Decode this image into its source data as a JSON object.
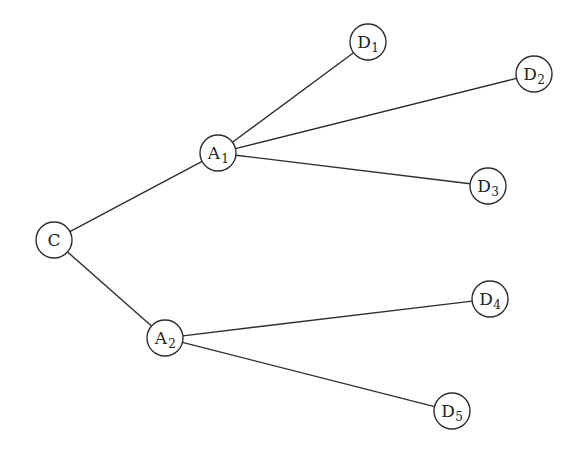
{
  "diagram": {
    "type": "tree",
    "colors": {
      "stroke": "#2e2e2e",
      "text": "#222222",
      "background": "#ffffff"
    },
    "node_radius": 18,
    "nodes": [
      {
        "id": "C",
        "label": "C",
        "sub": "",
        "x": 54,
        "y": 240
      },
      {
        "id": "A1",
        "label": "A",
        "sub": "1",
        "x": 218,
        "y": 153
      },
      {
        "id": "A2",
        "label": "A",
        "sub": "2",
        "x": 165,
        "y": 338
      },
      {
        "id": "D1",
        "label": "D",
        "sub": "1",
        "x": 368,
        "y": 42
      },
      {
        "id": "D2",
        "label": "D",
        "sub": "2",
        "x": 534,
        "y": 74
      },
      {
        "id": "D3",
        "label": "D",
        "sub": "3",
        "x": 488,
        "y": 186
      },
      {
        "id": "D4",
        "label": "D",
        "sub": "4",
        "x": 490,
        "y": 299
      },
      {
        "id": "D5",
        "label": "D",
        "sub": "5",
        "x": 452,
        "y": 411
      }
    ],
    "edges": [
      {
        "from": "C",
        "to": "A1"
      },
      {
        "from": "C",
        "to": "A2"
      },
      {
        "from": "A1",
        "to": "D1"
      },
      {
        "from": "A1",
        "to": "D2"
      },
      {
        "from": "A1",
        "to": "D3"
      },
      {
        "from": "A2",
        "to": "D4"
      },
      {
        "from": "A2",
        "to": "D5"
      }
    ]
  }
}
